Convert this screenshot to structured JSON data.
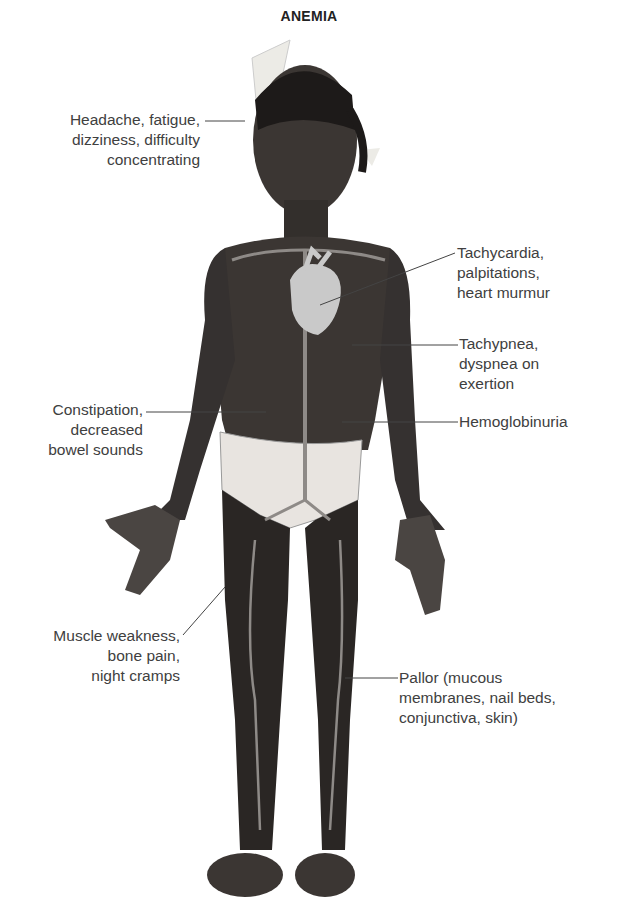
{
  "title": "ANEMIA",
  "labels": {
    "head": [
      "Headache, fatigue,",
      "dizziness, difficulty",
      "concentrating"
    ],
    "heart": [
      "Tachycardia,",
      "palpitations,",
      "heart murmur"
    ],
    "lungs": [
      "Tachypnea,",
      "dyspnea on",
      "exertion"
    ],
    "kidney": [
      "Hemoglobinuria"
    ],
    "bowel": [
      "Constipation,",
      "decreased",
      "bowel sounds"
    ],
    "muscle": [
      "Muscle weakness,",
      "bone pain,",
      "night cramps"
    ],
    "pallor": [
      "Pallor (mucous",
      "membranes, nail beds,",
      "conjunctiva, skin)"
    ]
  },
  "colors": {
    "skin": "#3b3633",
    "skin_dark": "#2a2624",
    "vessel": "#8e8a87",
    "heart": "#c9c9c9",
    "underwear": "#e8e4e0",
    "bow": "#ecebe6",
    "leader_line": "#444444"
  }
}
